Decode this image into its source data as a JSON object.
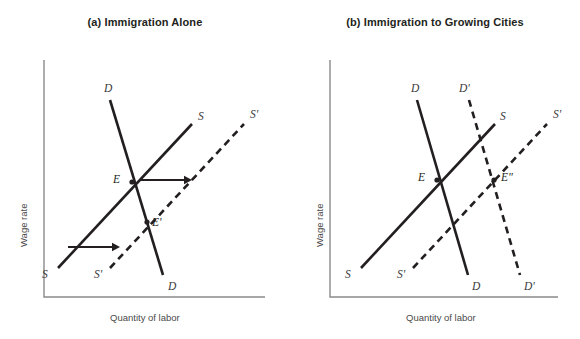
{
  "figure": {
    "background": "#ffffff",
    "ink_color": "#231f20",
    "axis_color": "#8a8a8a"
  },
  "panels": [
    {
      "id": "panel-a",
      "title": "(a) Immigration Alone",
      "x_axis_label": "Quantity of labor",
      "y_axis_label": "Wage rate"
    },
    {
      "id": "panel-b",
      "title": "(b) Immigration to Growing Cities",
      "x_axis_label": "Quantity of labor",
      "y_axis_label": "Wage rate"
    }
  ],
  "chart_data": [
    {
      "type": "line",
      "title": "(a) Immigration Alone",
      "xlabel": "Quantity of labor",
      "ylabel": "Wage rate",
      "grid": false,
      "legend": "none",
      "axis_origin": [
        44,
        297
      ],
      "axis_top": [
        44,
        60
      ],
      "axis_right": [
        265,
        297
      ],
      "series": [
        {
          "name": "D",
          "style": "solid",
          "from": [
            110,
            100
          ],
          "to": [
            163,
            275
          ],
          "label_start": {
            "text": "D",
            "x": 104,
            "y": 92
          },
          "label_end": {
            "text": "D",
            "x": 168,
            "y": 290
          }
        },
        {
          "name": "S",
          "style": "solid",
          "from": [
            58,
            268
          ],
          "to": [
            192,
            124
          ],
          "label_start": {
            "text": "S",
            "x": 42,
            "y": 278
          },
          "label_end": {
            "text": "S",
            "x": 198,
            "y": 120
          }
        },
        {
          "name": "S'",
          "style": "dashed",
          "from": [
            110,
            268
          ],
          "to": [
            244,
            124
          ],
          "label_start": {
            "text": "S'",
            "x": 94,
            "y": 278
          },
          "label_end": {
            "text": "S'",
            "x": 250,
            "y": 118
          }
        }
      ],
      "points": [
        {
          "name": "E",
          "x": 132,
          "y": 182,
          "label": "E",
          "label_x": 120,
          "label_y": 183
        },
        {
          "name": "E'",
          "x": 147,
          "y": 222,
          "label": "E'",
          "label_x": 152,
          "label_y": 226
        }
      ],
      "arrows": [
        {
          "name": "supply-shift-arrow-upper",
          "x1": 140,
          "y1": 180,
          "x2": 192,
          "y2": 180
        },
        {
          "name": "supply-shift-arrow-lower",
          "x1": 68,
          "y1": 247,
          "x2": 120,
          "y2": 247
        }
      ]
    },
    {
      "type": "line",
      "title": "(b) Immigration to Growing Cities",
      "xlabel": "Quantity of labor",
      "ylabel": "Wage rate",
      "grid": false,
      "legend": "none",
      "axis_origin": [
        330,
        297
      ],
      "axis_top": [
        330,
        60
      ],
      "axis_right": [
        558,
        297
      ],
      "series": [
        {
          "name": "D",
          "style": "solid",
          "from": [
            417,
            100
          ],
          "to": [
            468,
            275
          ],
          "label_start": {
            "text": "D",
            "x": 411,
            "y": 92
          },
          "label_end": {
            "text": "D",
            "x": 472,
            "y": 290
          }
        },
        {
          "name": "D'",
          "style": "dashed",
          "from": [
            469,
            100
          ],
          "to": [
            520,
            275
          ],
          "label_start": {
            "text": "D'",
            "x": 459,
            "y": 92
          },
          "label_end": {
            "text": "D'",
            "x": 524,
            "y": 290
          }
        },
        {
          "name": "S",
          "style": "solid",
          "from": [
            361,
            268
          ],
          "to": [
            495,
            124
          ],
          "label_start": {
            "text": "S",
            "x": 345,
            "y": 278
          },
          "label_end": {
            "text": "S",
            "x": 500,
            "y": 120
          }
        },
        {
          "name": "S'",
          "style": "dashed",
          "from": [
            413,
            268
          ],
          "to": [
            547,
            124
          ],
          "label_start": {
            "text": "S'",
            "x": 397,
            "y": 278
          },
          "label_end": {
            "text": "S'",
            "x": 553,
            "y": 118
          }
        }
      ],
      "points": [
        {
          "name": "E",
          "x": 437,
          "y": 180,
          "label": "E",
          "label_x": 425,
          "label_y": 181
        },
        {
          "name": "E\"",
          "x": 494,
          "y": 180,
          "label": "E\"",
          "label_x": 501,
          "label_y": 181
        }
      ],
      "arrows": []
    }
  ]
}
